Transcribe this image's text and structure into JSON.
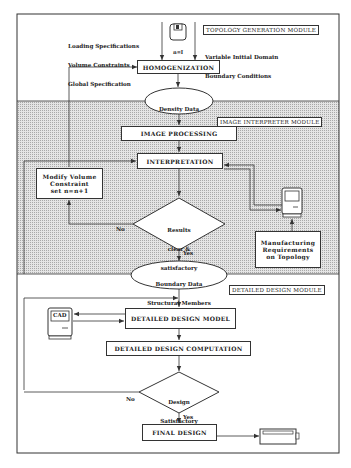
{
  "modules": {
    "topology": "TOPOLOGY GENERATION MODULE",
    "interpreter": "IMAGE INTERPRETER MODULE",
    "detailed": "DETAILED DESIGN MODULE"
  },
  "inputs": {
    "left_lines": [
      "Loading Specifications",
      "Volume Constraints",
      "Global Specification"
    ],
    "right_lines": [
      "Variable Initial Domain",
      "Boundary Conditions"
    ],
    "disk_label": "n=I"
  },
  "nodes": {
    "homogenization": "HOMOGENIZATION",
    "density_data": [
      "Density Data",
      "\"noisy\""
    ],
    "image_processing": "IMAGE PROCESSING",
    "interpretation": "INTERPRETATION",
    "modify_volume": [
      "Modify Volume",
      "Constraint",
      "set n=n+1"
    ],
    "results_decision": [
      "Results",
      "clear &",
      "satisfactory"
    ],
    "manufacturing": [
      "Manufacturing",
      "Requirements",
      "on Topology"
    ],
    "boundary_data": [
      "Boundary Data",
      "Structural Members"
    ],
    "cad": "CAD",
    "detailed_model": "DETAILED DESIGN MODEL",
    "detailed_computation": "DETAILED DESIGN COMPUTATION",
    "design_decision": [
      "Design",
      "Satisfactory"
    ],
    "final_design": "FINAL DESIGN"
  },
  "edge_labels": {
    "results_no": "No",
    "results_yes": "Yes",
    "design_no": "No",
    "design_yes": "Yes"
  },
  "colors": {
    "line": "#333333",
    "shade": "#d8d8d8",
    "background": "#ffffff"
  }
}
